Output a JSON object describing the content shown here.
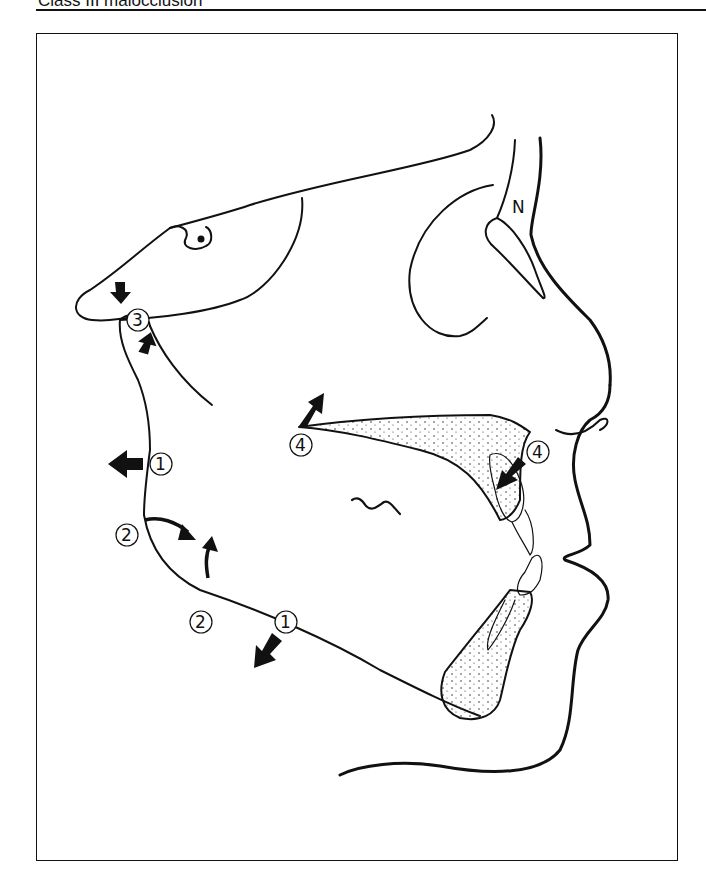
{
  "header": {
    "title": "Class III malocclusion"
  },
  "figure": {
    "landmark_labels": {
      "nasion": "N"
    },
    "markers": [
      {
        "id": "marker-1-ramus",
        "label": "①",
        "number": "1",
        "arrow": "left"
      },
      {
        "id": "marker-1-mandible",
        "label": "①",
        "number": "1",
        "arrow": "down-left"
      },
      {
        "id": "marker-2-gonial-upper",
        "label": "②",
        "number": "2",
        "arrow": "curved-right"
      },
      {
        "id": "marker-2-gonial-lower",
        "label": "②",
        "number": "2",
        "arrow": "curved-up"
      },
      {
        "id": "marker-3-condyle",
        "label": "③",
        "number": "3",
        "arrow": "up-and-down"
      },
      {
        "id": "marker-4-posterior-maxilla",
        "label": "④",
        "number": "4",
        "arrow": "up-right"
      },
      {
        "id": "marker-4-anterior-maxilla",
        "label": "④",
        "number": "4",
        "arrow": "down-left"
      }
    ]
  },
  "colors": {
    "ink": "#111111",
    "background": "#ffffff"
  }
}
